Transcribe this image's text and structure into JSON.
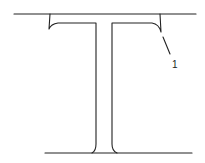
{
  "diagram": {
    "type": "rail-cross-section",
    "line_color": "#222222",
    "background": "#ffffff",
    "callouts": [
      {
        "id": "1",
        "label": "1",
        "target": "right flange fillet corner"
      }
    ]
  }
}
